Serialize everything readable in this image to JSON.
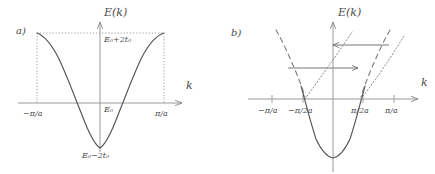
{
  "figure": {
    "background_color": "#ffffff",
    "ink_color": "#4a4a4a",
    "curve_color": "#555555"
  },
  "panel_a": {
    "tag": "a)",
    "y_axis_title": "E(k)",
    "x_axis_title": "k",
    "curve_description": "tight-binding cosine band E(k) = E0 - 2t0 cos(ka)",
    "labels": {
      "top_value": "E₀+2t₀",
      "origin_value": "E₀",
      "bottom_value": "E₀−2t₀"
    },
    "ticks": [
      {
        "name": "left-zone-boundary",
        "label": "−π/a"
      },
      {
        "name": "right-zone-boundary",
        "label": "π/a"
      }
    ],
    "guides": [
      {
        "name": "top-horizontal-dotted-guide",
        "style": "dotted",
        "orientation": "horizontal"
      },
      {
        "name": "left-vertical-dotted-guide",
        "style": "dotted",
        "orientation": "vertical"
      },
      {
        "name": "right-vertical-dotted-guide",
        "style": "dotted",
        "orientation": "vertical"
      }
    ]
  },
  "panel_b": {
    "tag": "b)",
    "y_axis_title": "E(k)",
    "x_axis_title": "k",
    "curve_description": "free-electron parabola with folded (dashed) and umklapp-shifted (dotted) branches",
    "ticks": [
      {
        "name": "tick-minus-pi-over-a",
        "label": "−π/a"
      },
      {
        "name": "tick-minus-pi-over-2a",
        "label": "−π/2a"
      },
      {
        "name": "tick-pi-over-2a",
        "label": "π/2a"
      },
      {
        "name": "tick-pi-over-a",
        "label": "π/a"
      }
    ],
    "curves": [
      {
        "name": "solid-parabola",
        "style": "solid"
      },
      {
        "name": "dashed-folded-branch-left",
        "style": "dashed"
      },
      {
        "name": "dashed-folded-branch-right",
        "style": "dashed"
      },
      {
        "name": "dotted-shifted-branch-left",
        "style": "dotted"
      },
      {
        "name": "dotted-shifted-branch-right",
        "style": "dotted"
      }
    ],
    "arrows": [
      {
        "name": "upper-scattering-arrow",
        "direction": "left"
      },
      {
        "name": "lower-scattering-arrow",
        "direction": "right"
      }
    ]
  }
}
